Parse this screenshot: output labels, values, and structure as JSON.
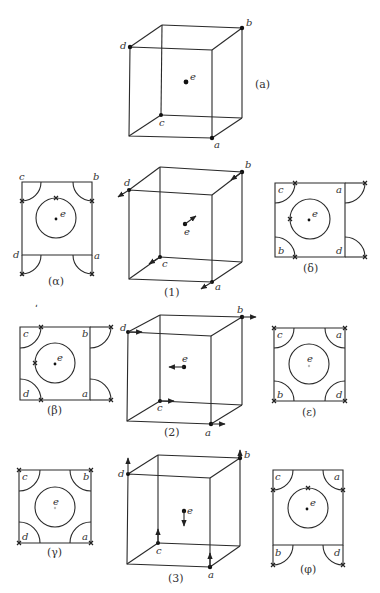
{
  "figure": {
    "main_cube": {
      "caption": "(a)",
      "vertices": {
        "a": "a",
        "b": "b",
        "c": "c",
        "d": "d",
        "e": "e"
      }
    },
    "cubes": [
      {
        "caption": "(1)",
        "labels": [
          "a",
          "b",
          "c",
          "d",
          "e"
        ],
        "motion": "diagonal arrows along body diagonals"
      },
      {
        "caption": "(2)",
        "labels": [
          "a",
          "b",
          "c",
          "d",
          "e"
        ],
        "motion": "horizontal arrows: corners right, center left"
      },
      {
        "caption": "(3)",
        "labels": [
          "a",
          "b",
          "c",
          "d",
          "e"
        ],
        "motion": "vertical arrows: corners up, center down"
      }
    ],
    "sections": [
      {
        "caption": "(α)",
        "labels": {
          "tl": "c",
          "tr": "b",
          "ml": "d",
          "mr": "a",
          "center": "e"
        }
      },
      {
        "caption": "(β)",
        "labels": {
          "tl": "c",
          "tr": "b",
          "bl": "d",
          "br": "a",
          "center": "e"
        }
      },
      {
        "caption": "(γ)",
        "labels": {
          "tl": "c",
          "tr": "b",
          "bl": "d",
          "br": "a",
          "center": "e"
        }
      },
      {
        "caption": "(δ)",
        "labels": {
          "tl": "c",
          "tr": "a",
          "bl": "b",
          "br": "d",
          "center": "e"
        }
      },
      {
        "caption": "(ε)",
        "labels": {
          "tl": "c",
          "tr": "a",
          "bl": "b",
          "br": "d",
          "center": "e"
        }
      },
      {
        "caption": "(φ)",
        "labels": {
          "tl": "c",
          "tr": "a",
          "ml": "b",
          "mr": "d",
          "center": "e"
        }
      }
    ],
    "side_mark": "ˌ"
  }
}
